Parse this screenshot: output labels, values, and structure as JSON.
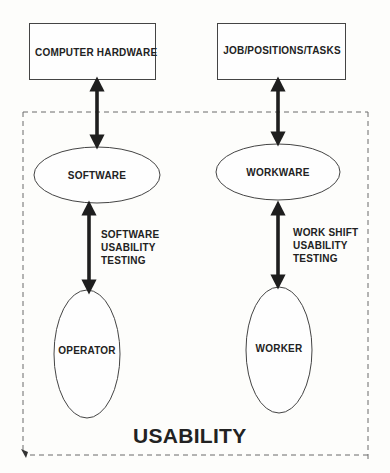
{
  "diagram": {
    "boxes": [
      {
        "id": "computer-hardware",
        "label": "COMPUTER HARDWARE"
      },
      {
        "id": "job-positions-tasks",
        "label": "JOB/POSITIONS/TASKS"
      }
    ],
    "ellipses": [
      {
        "id": "software",
        "label": "SOFTWARE"
      },
      {
        "id": "workware",
        "label": "WORKWARE"
      },
      {
        "id": "operator",
        "label": "OPERATOR"
      },
      {
        "id": "worker",
        "label": "WORKER"
      }
    ],
    "connectors": [
      {
        "from": "computer-hardware",
        "to": "software",
        "type": "double-arrow",
        "label": ""
      },
      {
        "from": "job-positions-tasks",
        "to": "workware",
        "type": "double-arrow",
        "label": ""
      },
      {
        "from": "software",
        "to": "operator",
        "type": "double-arrow",
        "label_lines": [
          "SOFTWARE",
          "USABILITY",
          "TESTING"
        ]
      },
      {
        "from": "workware",
        "to": "worker",
        "type": "double-arrow",
        "label_lines": [
          "WORK SHIFT",
          "USABILITY",
          "TESTING"
        ]
      }
    ],
    "boundary": {
      "style": "dashed",
      "label": "USABILITY"
    }
  },
  "colors": {
    "ink": "#222222",
    "background": "#fdfdfb",
    "dashed": "#666666"
  }
}
